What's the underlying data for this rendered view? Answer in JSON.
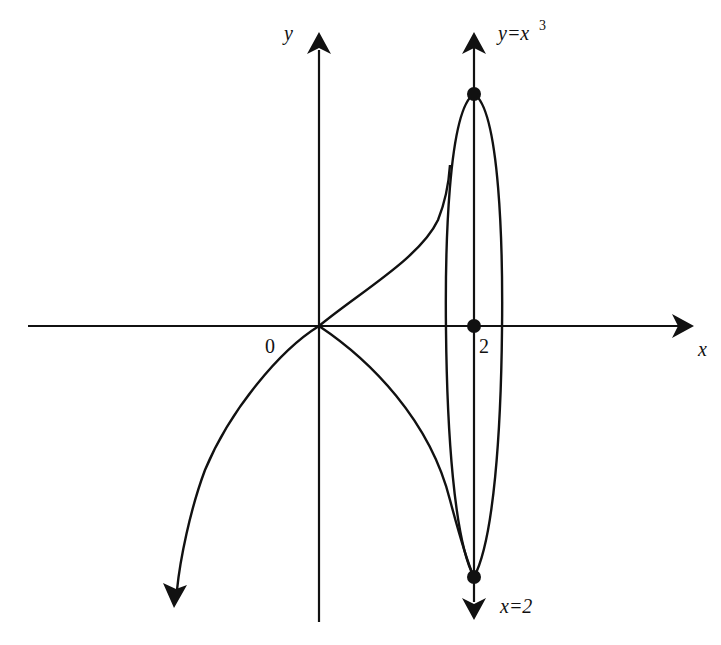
{
  "figure": {
    "type": "function-sketch",
    "axes": {
      "x_label": "x",
      "y_label": "y",
      "origin_label": "0",
      "tick_label_2": "2"
    },
    "curves": [
      {
        "name": "y=x^3 curve (cusp through origin)",
        "label_base": "y=x",
        "label_exp": "3"
      },
      {
        "name": "vertical line x=2",
        "label": "x=2"
      },
      {
        "name": "closed loop around x=2"
      }
    ],
    "points": [
      {
        "name": "top point on x=2"
      },
      {
        "name": "point (2,0)"
      },
      {
        "name": "bottom point on x=2"
      }
    ],
    "colors": {
      "stroke": "#111111",
      "background": "#ffffff"
    }
  }
}
